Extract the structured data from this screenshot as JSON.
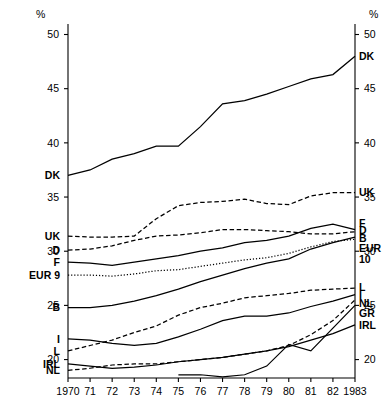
{
  "chart_data": {
    "type": "line",
    "title": "",
    "subtitle": "",
    "xlabel": "",
    "ylabel": "%",
    "unit_label": "%",
    "grid": false,
    "legend": "inline-series-labels",
    "ylim": [
      18.3,
      50.6
    ],
    "yticks": [
      20,
      25,
      30,
      35,
      40,
      45,
      50
    ],
    "ytick_labels_left": [
      "50",
      "45",
      "40",
      "35",
      "30",
      "25",
      "20"
    ],
    "ytick_labels_right": [
      "50",
      "45",
      "40",
      "35",
      "30",
      "25",
      "20"
    ],
    "x": [
      1970,
      1971,
      1972,
      1973,
      1974,
      1975,
      1976,
      1977,
      1978,
      1979,
      1980,
      1981,
      1982,
      1983
    ],
    "xtick_labels": [
      "1970",
      "71",
      "72",
      "73",
      "74",
      "75",
      "76",
      "77",
      "78",
      "79",
      "80",
      "81",
      "82",
      "1983"
    ],
    "series": [
      {
        "name": "DK",
        "label_left": "DK",
        "label_right": "DK",
        "style": "solid",
        "values": [
          37.0,
          37.5,
          38.5,
          39.0,
          39.7,
          39.7,
          41.5,
          43.6,
          43.9,
          44.5,
          45.2,
          45.9,
          46.3,
          48.0
        ]
      },
      {
        "name": "UK",
        "label_left": "UK",
        "label_right": "UK",
        "style": "dashed",
        "values": [
          31.4,
          31.3,
          31.3,
          31.4,
          33.0,
          34.2,
          34.5,
          34.6,
          34.8,
          34.4,
          34.3,
          35.1,
          35.4,
          35.4
        ]
      },
      {
        "name": "D",
        "label_left": "D",
        "label_right": "D",
        "style": "dashed",
        "values": [
          30.1,
          30.2,
          30.5,
          31.0,
          31.4,
          31.5,
          31.7,
          32.0,
          32.0,
          31.9,
          31.8,
          31.6,
          31.6,
          31.8
        ]
      },
      {
        "name": "F",
        "label_left": "F",
        "label_right": "F",
        "style": "solid",
        "values": [
          29.0,
          28.9,
          28.7,
          29.0,
          29.3,
          29.6,
          30.0,
          30.3,
          30.8,
          31.0,
          31.4,
          32.1,
          32.5,
          32.0
        ]
      },
      {
        "name": "EUR 9",
        "label_left": "EUR 9",
        "label_right": "EUR 10",
        "style": "dotted",
        "values": [
          27.8,
          27.8,
          27.7,
          27.9,
          28.2,
          28.3,
          28.6,
          28.9,
          29.2,
          29.4,
          29.8,
          30.4,
          30.9,
          31.1
        ]
      },
      {
        "name": "B",
        "label_left": "B",
        "label_right": "B",
        "style": "solid",
        "values": [
          24.8,
          24.8,
          25.0,
          25.4,
          25.9,
          26.5,
          27.2,
          27.8,
          28.4,
          28.9,
          29.3,
          30.2,
          30.8,
          31.3
        ]
      },
      {
        "name": "I",
        "label_left": "I",
        "label_right": "I",
        "style": "solid",
        "values": [
          21.9,
          21.8,
          21.5,
          21.3,
          21.5,
          22.1,
          22.8,
          23.6,
          24.0,
          24.0,
          24.3,
          24.9,
          25.4,
          26.0
        ]
      },
      {
        "name": "L",
        "label_left": "L",
        "label_right": "L",
        "style": "dashed",
        "values": [
          20.8,
          21.3,
          21.8,
          22.5,
          23.1,
          24.1,
          24.8,
          25.2,
          25.7,
          25.9,
          26.1,
          26.4,
          26.5,
          26.6
        ]
      },
      {
        "name": "IRL",
        "label_left": "IRL",
        "label_right": "IRL",
        "style": "solid",
        "values": [
          19.6,
          19.4,
          19.2,
          19.3,
          19.5,
          19.8,
          20.0,
          20.2,
          20.5,
          20.8,
          21.2,
          21.8,
          22.4,
          23.2
        ]
      },
      {
        "name": "NL",
        "label_left": "NL",
        "label_right": "NL",
        "style": "dashed",
        "values": [
          19.0,
          19.2,
          19.5,
          19.6,
          19.6,
          19.8,
          20.0,
          20.2,
          20.5,
          20.8,
          21.3,
          22.3,
          23.6,
          25.5
        ]
      },
      {
        "name": "GR",
        "label_right": "GR",
        "style": "solid",
        "values": [
          null,
          null,
          null,
          null,
          null,
          18.6,
          18.6,
          18.4,
          18.6,
          19.4,
          21.4,
          20.8,
          22.9,
          25.0
        ]
      }
    ],
    "left_labels": [
      "DK",
      "UK",
      "D",
      "F",
      "EUR 9",
      "B",
      "I",
      "L",
      "IRL",
      "NL"
    ],
    "right_labels": [
      "DK",
      "UK",
      "F",
      "D",
      "B",
      "EUR 10",
      "L",
      "I",
      "NL",
      "GR",
      "IRL"
    ]
  }
}
